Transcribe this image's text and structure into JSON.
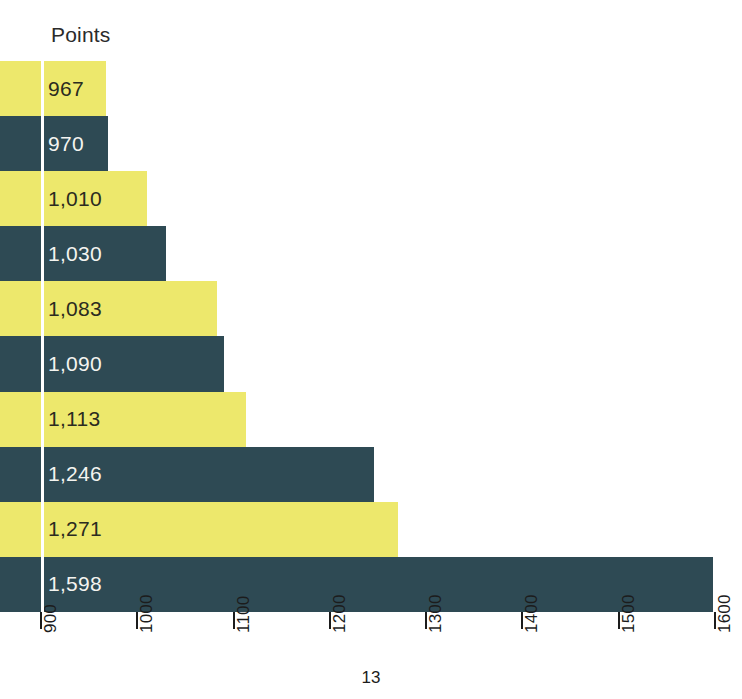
{
  "header": {
    "column_label": "Points"
  },
  "footer": {
    "page_number": "13"
  },
  "colors": {
    "bar_yellow": "#EDE86C",
    "bar_teal": "#2E4A54",
    "label_on_yellow": "#2B2B20",
    "label_on_teal": "#F4F4F0",
    "axis": "#1C1C1C",
    "background": "#FFFFFF"
  },
  "chart_data": {
    "type": "bar",
    "orientation": "horizontal",
    "title": "",
    "subtitle": "",
    "xlabel": "",
    "ylabel": "Points",
    "xlim": [
      900,
      1600
    ],
    "grid": false,
    "legend": null,
    "categories": [
      "",
      "",
      "",
      "",
      "",
      "",
      "",
      "",
      "",
      ""
    ],
    "values": [
      967,
      970,
      1010,
      1030,
      1083,
      1090,
      1113,
      1246,
      1271,
      1598
    ],
    "bars": [
      {
        "label": "967",
        "value": 967,
        "color": "yellow"
      },
      {
        "label": "970",
        "value": 970,
        "color": "teal"
      },
      {
        "label": "1,010",
        "value": 1010,
        "color": "yellow"
      },
      {
        "label": "1,030",
        "value": 1030,
        "color": "teal"
      },
      {
        "label": "1,083",
        "value": 1083,
        "color": "yellow"
      },
      {
        "label": "1,090",
        "value": 1090,
        "color": "teal"
      },
      {
        "label": "1,113",
        "value": 1113,
        "color": "yellow"
      },
      {
        "label": "1,246",
        "value": 1246,
        "color": "teal"
      },
      {
        "label": "1,271",
        "value": 1271,
        "color": "yellow"
      },
      {
        "label": "1,598",
        "value": 1598,
        "color": "teal"
      }
    ],
    "x_ticks": [
      {
        "value": 900,
        "label": "900"
      },
      {
        "value": 1000,
        "label": "1000"
      },
      {
        "value": 1100,
        "label": "1100"
      },
      {
        "value": 1200,
        "label": "1200"
      },
      {
        "value": 1300,
        "label": "1300"
      },
      {
        "value": 1400,
        "label": "1400"
      },
      {
        "value": 1500,
        "label": "1500"
      },
      {
        "value": 1600,
        "label": "1600"
      }
    ],
    "tick_label_rotation_deg": -90
  },
  "geometry": {
    "axis_x_start_px": 41,
    "axis_x_end_px": 715,
    "plot_top_px": 61,
    "bar_height_px": 55.1
  }
}
